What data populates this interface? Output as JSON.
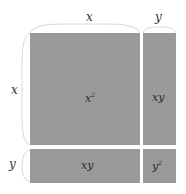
{
  "diagram": {
    "title": "",
    "dimensions": {
      "top_x": "x",
      "top_y": "y",
      "left_x": "x",
      "left_y": "y"
    },
    "regions": {
      "big_square": {
        "base": "x",
        "exp": "2"
      },
      "right_rect": {
        "label": "xy"
      },
      "bottom_rect": {
        "label": "xy"
      },
      "small_square": {
        "base": "y",
        "exp": "2"
      }
    },
    "colors": {
      "fill": "#9a9a9a",
      "brace": "#d8d8d8",
      "background": "#ffffff"
    }
  }
}
